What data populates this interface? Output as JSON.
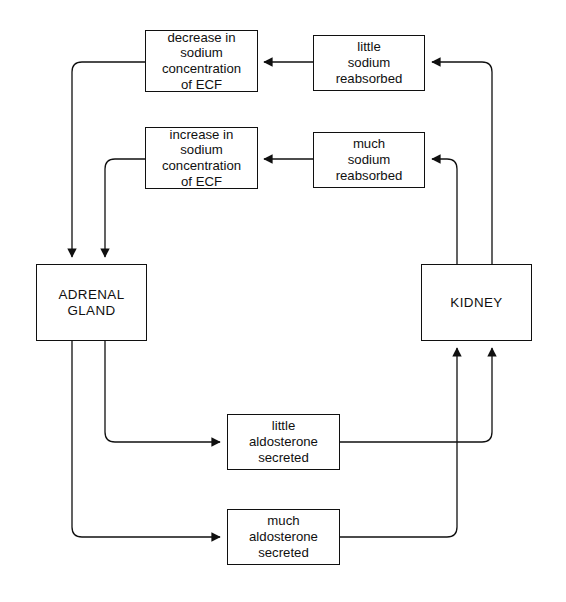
{
  "diagram": {
    "line_color": "#101010",
    "background_color": "#ffffff",
    "nodes": {
      "decrease_ecf": "decrease in\nsodium\nconcentration\nof ECF",
      "little_reabsorbed": "little\nsodium\nreabsorbed",
      "increase_ecf": "increase in\nsodium\nconcentration\nof ECF",
      "much_reabsorbed": "much\nsodium\nreabsorbed",
      "adrenal_gland": "ADRENAL\nGLAND",
      "kidney": "KIDNEY",
      "little_aldosterone": "little\naldosterone\nsecreted",
      "much_aldosterone": "much\naldosterone\nsecreted"
    },
    "edges": [
      {
        "from": "little_reabsorbed",
        "to": "decrease_ecf",
        "name": "edge-little-reabsorbed-to-decrease-ecf"
      },
      {
        "from": "much_reabsorbed",
        "to": "increase_ecf",
        "name": "edge-much-reabsorbed-to-increase-ecf"
      },
      {
        "from": "decrease_ecf",
        "to": "adrenal_gland",
        "name": "edge-decrease-ecf-to-adrenal-gland"
      },
      {
        "from": "increase_ecf",
        "to": "adrenal_gland",
        "name": "edge-increase-ecf-to-adrenal-gland"
      },
      {
        "from": "adrenal_gland",
        "to": "little_aldosterone",
        "name": "edge-adrenal-gland-to-little-aldosterone"
      },
      {
        "from": "adrenal_gland",
        "to": "much_aldosterone",
        "name": "edge-adrenal-gland-to-much-aldosterone"
      },
      {
        "from": "little_aldosterone",
        "to": "kidney",
        "name": "edge-little-aldosterone-to-kidney"
      },
      {
        "from": "much_aldosterone",
        "to": "kidney",
        "name": "edge-much-aldosterone-to-kidney"
      },
      {
        "from": "kidney",
        "to": "little_reabsorbed",
        "name": "edge-kidney-to-little-reabsorbed"
      },
      {
        "from": "kidney",
        "to": "much_reabsorbed",
        "name": "edge-kidney-to-much-reabsorbed"
      }
    ]
  }
}
